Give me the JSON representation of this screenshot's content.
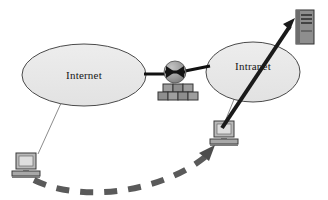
{
  "diagram": {
    "type": "network-security-diagram",
    "background_color": "#ffffff"
  },
  "zones": [
    {
      "id": "internet",
      "label": "Internet",
      "shape": "ellipse",
      "cx": 84,
      "cy": 75,
      "rx": 62,
      "ry": 31,
      "fill": "#e9e9e9",
      "stroke": "#4a4a4a"
    },
    {
      "id": "intranet",
      "label": "Intranet",
      "shape": "ellipse",
      "cx": 253,
      "cy": 72,
      "rx": 47,
      "ry": 30,
      "fill": "#e9e9e9",
      "stroke": "#4a4a4a"
    }
  ],
  "nodes": [
    {
      "id": "firewall",
      "name": "firewall",
      "icon": "brick-wall-icon",
      "x": 158,
      "y": 62,
      "brick_fill": "#9a9a9a",
      "brick_stroke": "#3a3a3a",
      "sphere_fill": "#9a9a9a"
    },
    {
      "id": "external-client",
      "name": "external-computer",
      "icon": "desktop-computer-icon",
      "x": 14,
      "y": 152,
      "fill": "#b9b9b9",
      "screen_fill": "#dedede",
      "stroke": "#3a3a3a"
    },
    {
      "id": "internal-client",
      "name": "internal-computer",
      "icon": "desktop-computer-icon",
      "x": 211,
      "y": 120,
      "fill": "#b9b9b9",
      "screen_fill": "#dedede",
      "stroke": "#3a3a3a"
    },
    {
      "id": "server",
      "name": "tower-server",
      "icon": "server-tower-icon",
      "x": 294,
      "y": 9,
      "fill": "#8e8e8e",
      "panel_fill": "#6f6f6f",
      "stroke": "#2f2f2f"
    }
  ],
  "links": [
    {
      "id": "internet-to-firewall",
      "name": "internet-firewall-trunk",
      "style": "solid-thick",
      "color": "#111111",
      "width": 3
    },
    {
      "id": "firewall-to-intranet",
      "name": "firewall-intranet-trunk",
      "style": "solid-thick",
      "color": "#111111",
      "width": 3
    },
    {
      "id": "internet-to-external-client",
      "name": "internet-client-link",
      "style": "solid-thin",
      "color": "#8c8c8c",
      "width": 1
    },
    {
      "id": "intranet-to-internal-client",
      "name": "intranet-client-link",
      "style": "solid-thin",
      "color": "#8c8c8c",
      "width": 1
    },
    {
      "id": "internal-client-to-server",
      "name": "attack-escalation-arrow",
      "style": "solid-arrow",
      "color": "#1a1a1a",
      "width": 4
    },
    {
      "id": "external-client-to-internal-client",
      "name": "tunneled-attack-arrow",
      "style": "dashed-curved-arrow",
      "color": "#5a5a5a",
      "width": 6,
      "dash": "13 11"
    }
  ]
}
